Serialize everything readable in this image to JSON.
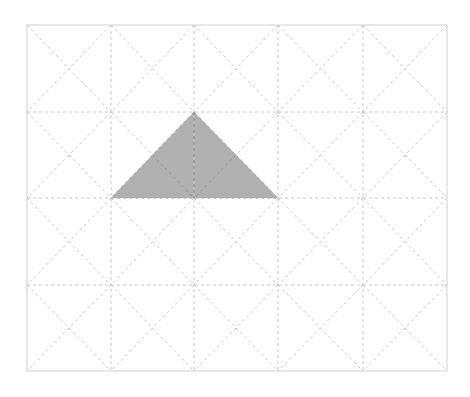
{
  "diagram": {
    "type": "triangular-grid",
    "grid": {
      "x_lines": [
        27,
        111,
        194,
        278,
        363,
        447
      ],
      "y_lines": [
        25,
        112,
        198,
        285,
        371
      ],
      "columns": 5,
      "rows": 4,
      "line_color": "#c8c8c8",
      "border_color": "#cfcfcf",
      "dash": "3,3",
      "diagonals": "both-per-cell"
    },
    "shaded_triangle": {
      "points": [
        [
          194,
          112
        ],
        [
          111,
          198
        ],
        [
          278,
          198
        ]
      ],
      "fill": "#b0b0b0",
      "inner_line_color": "#8a8a8a"
    }
  }
}
